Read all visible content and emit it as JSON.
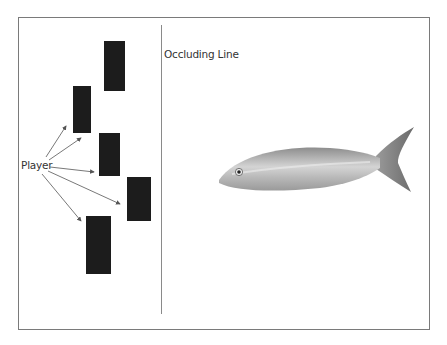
{
  "labels": {
    "player": "Player",
    "occluding_line": "Occluding Line"
  },
  "colors": {
    "frame": "#7a7a7a",
    "line": "#8a8a8a",
    "block": "#1c1c1c",
    "arrow": "#555555"
  },
  "blocks": [
    {
      "id": "block-1",
      "x": 104,
      "y": 41,
      "w": 21,
      "h": 50
    },
    {
      "id": "block-2",
      "x": 73,
      "y": 86,
      "w": 18,
      "h": 47
    },
    {
      "id": "block-3",
      "x": 99,
      "y": 133,
      "w": 21,
      "h": 43
    },
    {
      "id": "block-4",
      "x": 127,
      "y": 177,
      "w": 24,
      "h": 44
    },
    {
      "id": "block-5",
      "x": 86,
      "y": 216,
      "w": 25,
      "h": 58
    }
  ],
  "icons": {
    "fish": "fish-illustration"
  }
}
